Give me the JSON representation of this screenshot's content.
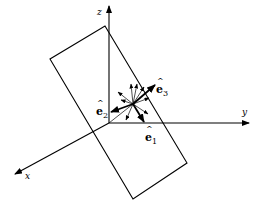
{
  "diagram": {
    "axes": {
      "x": {
        "label": "x"
      },
      "y": {
        "label": "y"
      },
      "z": {
        "label": "z"
      }
    },
    "vectors": {
      "e1": {
        "label": "e",
        "subscript": "1",
        "hat": "^"
      },
      "e2": {
        "label": "e",
        "subscript": "2",
        "hat": "^"
      },
      "e3": {
        "label": "e",
        "subscript": "3",
        "hat": "^"
      }
    },
    "colors": {
      "stroke": "#000000",
      "background": "#ffffff"
    }
  }
}
